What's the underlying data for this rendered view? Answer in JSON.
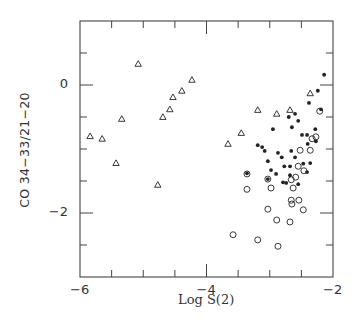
{
  "chart_data": {
    "type": "scatter",
    "title": "",
    "xlabel": "Log S(2)",
    "ylabel": "CO 34−33/21−20",
    "xlim": [
      -6,
      -2
    ],
    "ylim": [
      -3,
      1
    ],
    "xticks": [
      -6,
      -4,
      -2
    ],
    "xtick_labels": [
      "−6",
      "−4",
      "−2"
    ],
    "yticks": [
      0,
      -2
    ],
    "ytick_labels": [
      "0",
      "−2"
    ],
    "minor_tick_step": 0.5,
    "grid": false,
    "legend": null,
    "series": [
      {
        "name": "triangles",
        "marker": "open-triangle",
        "points": [
          [
            -5.84,
            -0.8
          ],
          [
            -5.65,
            -0.84
          ],
          [
            -5.43,
            -1.22
          ],
          [
            -5.34,
            -0.53
          ],
          [
            -5.08,
            0.33
          ],
          [
            -4.77,
            -1.56
          ],
          [
            -4.69,
            -0.5
          ],
          [
            -4.58,
            -0.38
          ],
          [
            -4.53,
            -0.19
          ],
          [
            -4.39,
            -0.09
          ],
          [
            -4.23,
            0.08
          ],
          [
            -3.66,
            -0.92
          ],
          [
            -3.45,
            -0.75
          ],
          [
            -3.19,
            -0.39
          ],
          [
            -2.89,
            -0.45
          ],
          [
            -2.68,
            -0.39
          ],
          [
            -2.36,
            -0.13
          ]
        ]
      },
      {
        "name": "filled circles",
        "marker": "filled-circle",
        "points": [
          [
            -2.14,
            0.16
          ],
          [
            -2.24,
            -0.09
          ],
          [
            -2.38,
            -0.28
          ],
          [
            -2.19,
            -0.38
          ],
          [
            -2.6,
            -0.45
          ],
          [
            -2.7,
            -0.5
          ],
          [
            -2.55,
            -0.56
          ],
          [
            -2.65,
            -0.66
          ],
          [
            -2.95,
            -0.69
          ],
          [
            -2.28,
            -0.69
          ],
          [
            -2.49,
            -0.78
          ],
          [
            -2.41,
            -0.78
          ],
          [
            -2.27,
            -0.88
          ],
          [
            -2.4,
            -0.92
          ],
          [
            -3.19,
            -0.94
          ],
          [
            -3.12,
            -0.97
          ],
          [
            -3.08,
            -1.03
          ],
          [
            -2.87,
            -1.06
          ],
          [
            -2.66,
            -1.03
          ],
          [
            -2.6,
            -1.13
          ],
          [
            -2.81,
            -1.13
          ],
          [
            -3.03,
            -1.19
          ],
          [
            -2.47,
            -1.23
          ],
          [
            -2.36,
            -1.22
          ],
          [
            -2.77,
            -1.27
          ],
          [
            -2.68,
            -1.27
          ],
          [
            -2.98,
            -1.33
          ],
          [
            -2.9,
            -1.39
          ],
          [
            -2.68,
            -1.41
          ],
          [
            -2.41,
            -1.36
          ],
          [
            -3.36,
            -1.38
          ],
          [
            -3.03,
            -1.47
          ],
          [
            -2.79,
            -1.52
          ],
          [
            -2.74,
            -1.53
          ],
          [
            -2.55,
            -1.55
          ]
        ]
      },
      {
        "name": "open circles",
        "marker": "open-circle",
        "points": [
          [
            -2.21,
            -0.41
          ],
          [
            -2.27,
            -0.81
          ],
          [
            -2.33,
            -0.84
          ],
          [
            -2.52,
            -1.02
          ],
          [
            -2.36,
            -1.02
          ],
          [
            -2.55,
            -1.27
          ],
          [
            -2.46,
            -1.34
          ],
          [
            -2.59,
            -1.44
          ],
          [
            -2.66,
            -1.48
          ],
          [
            -3.36,
            -1.39
          ],
          [
            -3.03,
            -1.47
          ],
          [
            -3.36,
            -1.63
          ],
          [
            -2.98,
            -1.61
          ],
          [
            -2.63,
            -1.61
          ],
          [
            -2.66,
            -1.8
          ],
          [
            -2.65,
            -1.86
          ],
          [
            -2.54,
            -1.8
          ],
          [
            -2.47,
            -1.95
          ],
          [
            -3.03,
            -1.94
          ],
          [
            -2.89,
            -2.11
          ],
          [
            -2.68,
            -2.14
          ],
          [
            -3.58,
            -2.34
          ],
          [
            -3.19,
            -2.42
          ],
          [
            -2.87,
            -2.52
          ]
        ]
      }
    ],
    "colors": {
      "axis": "#444444",
      "marker": "#222222",
      "background": "#ffffff"
    }
  }
}
